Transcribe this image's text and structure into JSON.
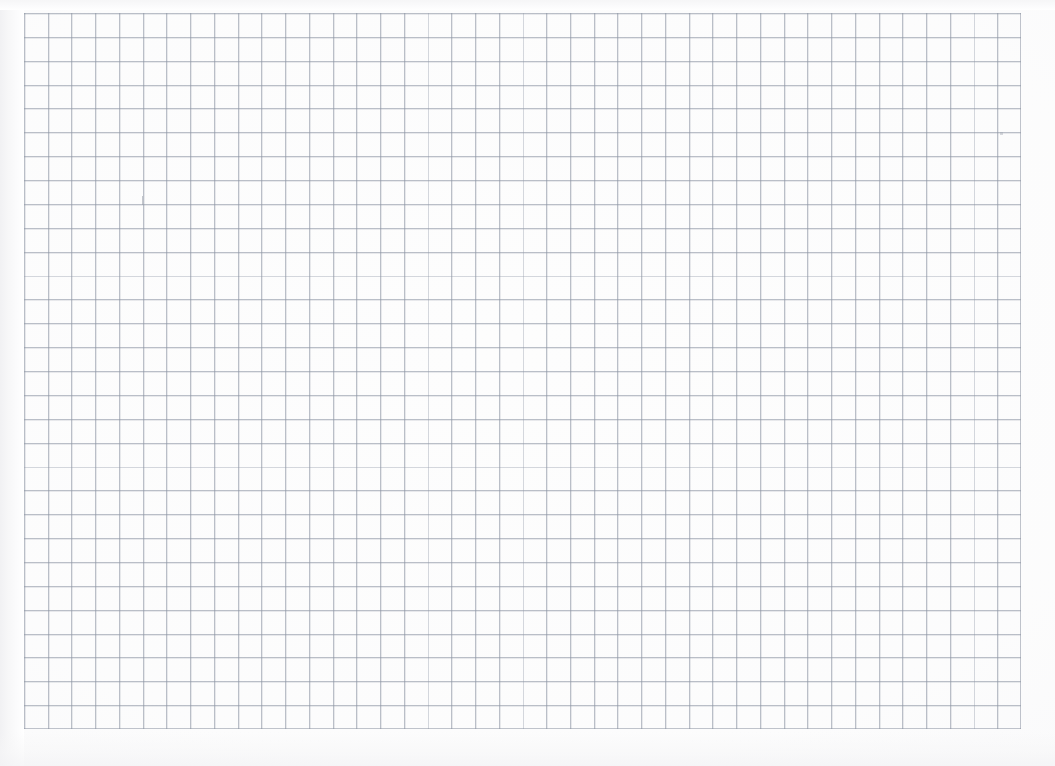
{
  "document": {
    "kind": "scanned-graph-paper",
    "title": "Blank square-ruled graph paper sheet",
    "caption": "Blank square-ruled graph paper sheet",
    "paper_color": "#fdfdfd",
    "page_background": "#ffffff"
  },
  "grid": {
    "line_color": "#8c94a2",
    "line_color_soft": "#969eac",
    "columns": 42,
    "rows": 30,
    "cell_width_px": 23.74,
    "cell_height_px": 23.87,
    "origin_x_px": 24,
    "origin_y_px": 13,
    "width_px": 997,
    "height_px": 716,
    "style": "uniform single-weight square ruling, no major gridlines"
  },
  "artifacts": {
    "left_shadow_label": "scanner edge shadow",
    "top_shadow_label": "scanner top shading",
    "bottom_shadow_label": "scanner bottom shading",
    "stray_marks": [
      {
        "name": "pencil tick",
        "x": 142,
        "y": 196
      },
      {
        "name": "faint speck",
        "x": 1000,
        "y": 132
      }
    ]
  }
}
